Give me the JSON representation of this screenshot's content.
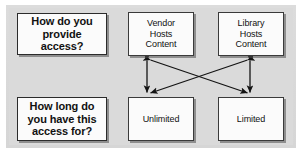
{
  "diagram": {
    "panel_color": "#d9d9d9",
    "box_fill": "#fbfbfb",
    "box_border": "#3a3a3a",
    "connector_color": "#1a1a1a",
    "questions": [
      {
        "id": "q-access",
        "label": "How do you provide access?"
      },
      {
        "id": "q-duration",
        "label": "How long do you have this access for?"
      }
    ],
    "hosting_options": [
      {
        "id": "vendor",
        "line1": "Vendor",
        "line2": "Hosts",
        "line3": "Content"
      },
      {
        "id": "library",
        "line1": "Library",
        "line2": "Hosts",
        "line3": "Content"
      }
    ],
    "duration_options": [
      {
        "id": "unlimited",
        "label": "Unlimited"
      },
      {
        "id": "limited",
        "label": "Limited"
      }
    ],
    "connectors": [
      {
        "from": "vendor",
        "to": "unlimited",
        "style": "vertical",
        "arrowheads": "both"
      },
      {
        "from": "library",
        "to": "limited",
        "style": "vertical",
        "arrowheads": "both"
      },
      {
        "from": "vendor",
        "to": "limited",
        "style": "diagonal",
        "arrowheads": "both"
      },
      {
        "from": "library",
        "to": "unlimited",
        "style": "diagonal",
        "arrowheads": "both"
      }
    ]
  }
}
